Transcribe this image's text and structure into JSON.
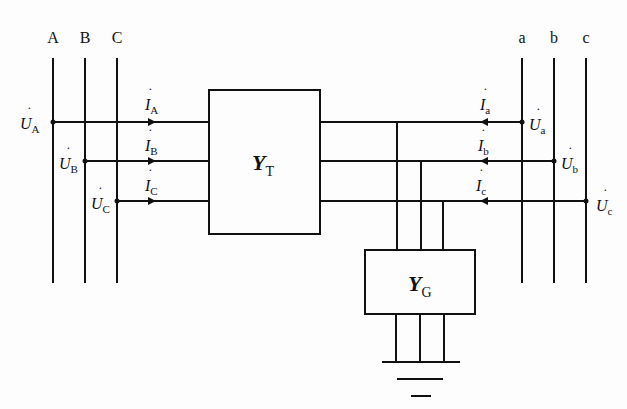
{
  "left_buses": [
    {
      "label": "A",
      "voltage": "U",
      "voltage_sub": "A",
      "current": "I",
      "current_sub": "A"
    },
    {
      "label": "B",
      "voltage": "U",
      "voltage_sub": "B",
      "current": "I",
      "current_sub": "B"
    },
    {
      "label": "C",
      "voltage": "U",
      "voltage_sub": "C",
      "current": "I",
      "current_sub": "C"
    }
  ],
  "right_buses": [
    {
      "label": "a",
      "voltage": "U",
      "voltage_sub": "a",
      "current": "I",
      "current_sub": "a"
    },
    {
      "label": "b",
      "voltage": "U",
      "voltage_sub": "b",
      "current": "I",
      "current_sub": "b"
    },
    {
      "label": "c",
      "voltage": "U",
      "voltage_sub": "c",
      "current": "I",
      "current_sub": "c"
    }
  ],
  "transformer_block": {
    "symbol": "Y",
    "sub": "T"
  },
  "ground_block": {
    "symbol": "Y",
    "sub": "G"
  },
  "dot": "˙"
}
